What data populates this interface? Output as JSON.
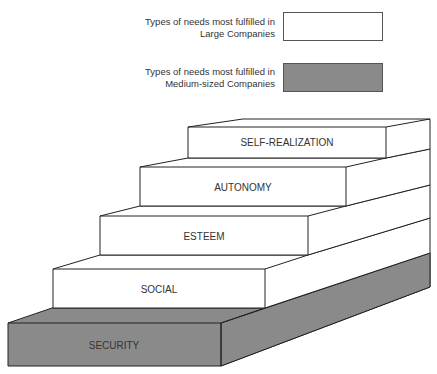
{
  "legend": [
    {
      "line1": "Types of needs most fulfilled in",
      "line2": "Large Companies",
      "fill": "#ffffff"
    },
    {
      "line1": "Types of needs most fulfilled in",
      "line2": "Medium-sized Companies",
      "fill": "#8a8a8a"
    }
  ],
  "steps": [
    {
      "label": "SECURITY",
      "category": "Medium-sized Companies",
      "fill": "#8a8a8a"
    },
    {
      "label": "SOCIAL",
      "category": "Large Companies",
      "fill": "#ffffff"
    },
    {
      "label": "ESTEEM",
      "category": "Large Companies",
      "fill": "#ffffff"
    },
    {
      "label": "AUTONOMY",
      "category": "Large Companies",
      "fill": "#ffffff"
    },
    {
      "label": "SELF-REALIZATION",
      "category": "Large Companies",
      "fill": "#ffffff"
    }
  ]
}
